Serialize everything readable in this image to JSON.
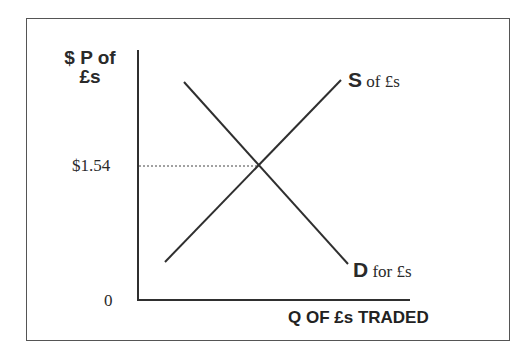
{
  "diagram": {
    "type": "supply-demand",
    "y_axis_label_line1": "$ P of",
    "y_axis_label_line2": "£s",
    "x_axis_label": "Q OF £s TRADED",
    "origin_label": "0",
    "equilibrium_price_label": "$1.54",
    "supply_curve": {
      "letter": "S",
      "suffix": "of £s"
    },
    "demand_curve": {
      "letter": "D",
      "suffix": "for £s"
    },
    "colors": {
      "lines": "#2f2f2f",
      "frame": "#555555",
      "text": "#2a2a2a"
    }
  }
}
